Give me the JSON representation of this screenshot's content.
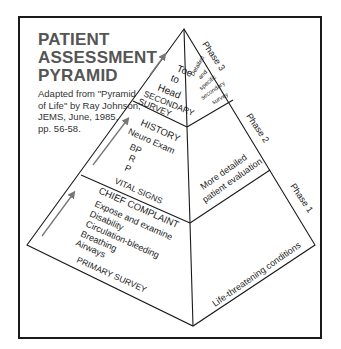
{
  "title": {
    "lines": [
      "PATIENT",
      "ASSESSMENT",
      "PYRAMID"
    ]
  },
  "credit": {
    "lines": [
      "Adapted from \"Pyramid",
      "of Life\" by Ray Johnson,",
      "JEMS, June, 1985,",
      "pp. 56-58."
    ]
  },
  "pyramid": {
    "left_face": {
      "top": {
        "items": [
          "Toe",
          "to",
          "Head"
        ],
        "label": "SECONDARY",
        "label2": "SURVEY"
      },
      "middle": {
        "header": "HISTORY",
        "items": [
          "Neuro Exam",
          "BP",
          "R",
          "P"
        ],
        "label": "VITAL SIGNS"
      },
      "bottom": {
        "header": "CHIEF COMPLAINT",
        "items": [
          "Expose and examine",
          "Disability",
          "Circulation-bleeding",
          "Breathing",
          "Airways"
        ],
        "label": "PRIMARY SURVEY"
      }
    },
    "right_face": {
      "top": {
        "lines": [
          "Detailed",
          "and",
          "specific",
          "secondary",
          "survey"
        ]
      },
      "middle": {
        "lines": [
          "More detailed",
          "patient evaluation"
        ]
      },
      "bottom": {
        "lines": [
          "Life-threatening conditions"
        ]
      }
    },
    "phases": [
      "Phase 3",
      "Phase 2",
      "Phase 1"
    ]
  },
  "colors": {
    "line": "#1a1a1a",
    "title": "#555555",
    "arrow": "#777777"
  }
}
